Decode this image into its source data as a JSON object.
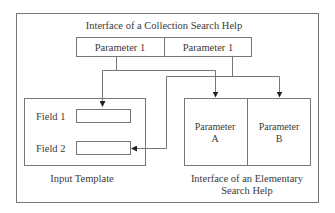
{
  "diagram": {
    "outer": {
      "title": "Interface of a Collection Search Help"
    },
    "collection_parameters": [
      {
        "label": "Parameter 1"
      },
      {
        "label": "Parameter 1"
      }
    ],
    "input_template": {
      "caption": "Input Template",
      "fields": [
        {
          "label": "Field 1"
        },
        {
          "label": "Field 2"
        }
      ]
    },
    "elementary_interface": {
      "caption_line1": "Interface of an Elementary",
      "caption_line2": "Search Help",
      "parameters": [
        {
          "line1": "Parameter",
          "line2": "A"
        },
        {
          "line1": "Parameter",
          "line2": "B"
        }
      ]
    },
    "colors": {
      "line": "#6a6a6a",
      "arrow": "#222222",
      "text": "#3a3a3a"
    }
  }
}
